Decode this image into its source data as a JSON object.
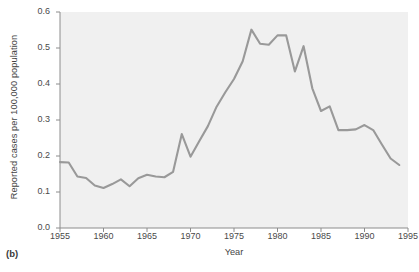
{
  "figure": {
    "panel_tag": "(b)"
  },
  "chart_data": {
    "type": "line",
    "title": "",
    "xlabel": "Year",
    "ylabel": "Reported cases per 100,000 population",
    "xlim": [
      1955,
      1995
    ],
    "ylim": [
      0.0,
      0.6
    ],
    "grid": false,
    "legend": "none",
    "line_color": "#999999",
    "plot_background": "#f0f0f0",
    "xticks": [
      1955,
      1960,
      1965,
      1970,
      1975,
      1980,
      1985,
      1990,
      1995
    ],
    "xtick_labels": [
      "1955",
      "1960",
      "1965",
      "1970",
      "1975",
      "1980",
      "1985",
      "1990",
      "1995"
    ],
    "yticks": [
      0.0,
      0.1,
      0.2,
      0.3,
      0.4,
      0.5,
      0.6
    ],
    "ytick_labels": [
      "0.0",
      "0.1",
      "0.2",
      "0.3",
      "0.4",
      "0.5",
      "0.6"
    ],
    "x": [
      1955,
      1956,
      1957,
      1958,
      1959,
      1960,
      1961,
      1962,
      1963,
      1964,
      1965,
      1966,
      1967,
      1968,
      1969,
      1970,
      1971,
      1972,
      1973,
      1974,
      1975,
      1976,
      1977,
      1978,
      1979,
      1980,
      1981,
      1982,
      1983,
      1984,
      1985,
      1986,
      1987,
      1988,
      1989,
      1990,
      1991,
      1992,
      1993,
      1994
    ],
    "values": [
      0.183,
      0.182,
      0.143,
      0.139,
      0.118,
      0.111,
      0.122,
      0.135,
      0.116,
      0.138,
      0.148,
      0.143,
      0.141,
      0.156,
      0.261,
      0.198,
      0.241,
      0.283,
      0.337,
      0.377,
      0.414,
      0.463,
      0.551,
      0.512,
      0.509,
      0.535,
      0.535,
      0.435,
      0.505,
      0.388,
      0.325,
      0.338,
      0.272,
      0.272,
      0.274,
      0.286,
      0.272,
      0.232,
      0.193,
      0.175
    ]
  }
}
